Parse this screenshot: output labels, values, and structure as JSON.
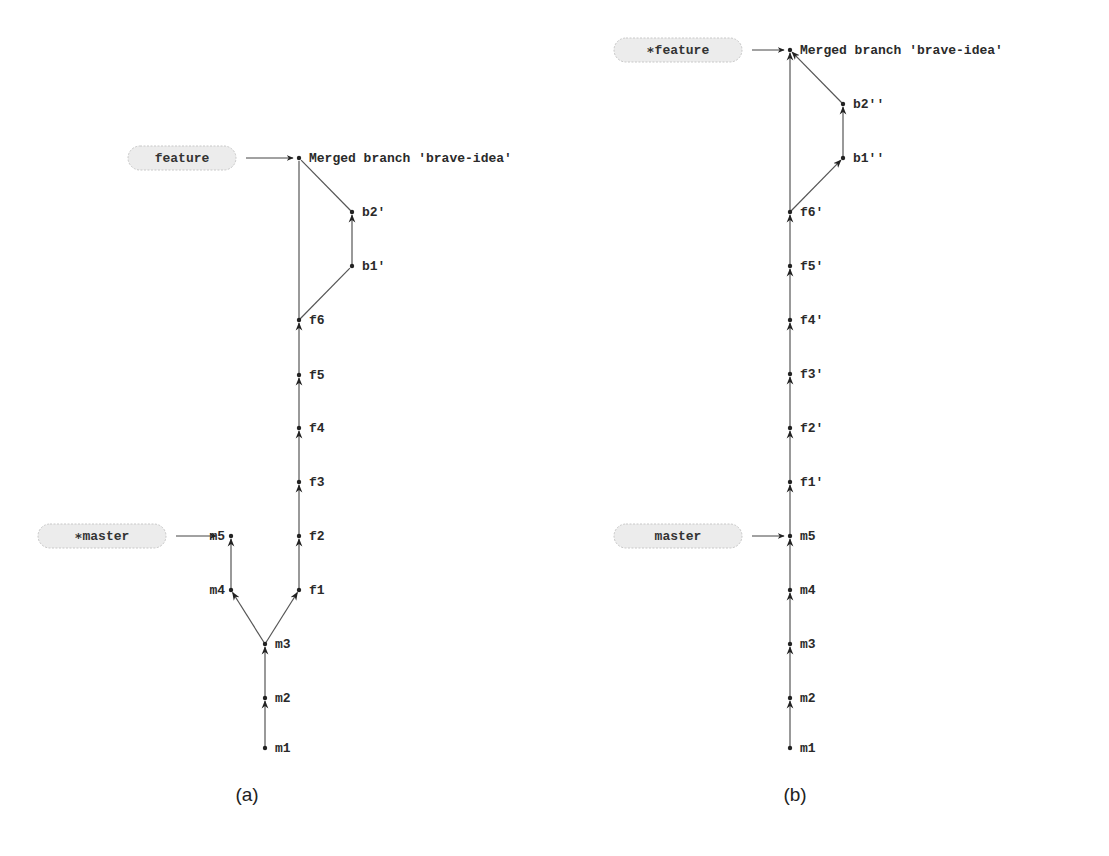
{
  "diagrams": [
    {
      "id": "a",
      "caption": "(a)",
      "caption_pos": [
        247,
        801
      ],
      "refs": [
        {
          "label": "feature",
          "star": false,
          "x": 128,
          "y": 158,
          "w": 108,
          "target": [
            299,
            158
          ]
        },
        {
          "label": "master",
          "star": true,
          "x": 38,
          "y": 536,
          "w": 128,
          "target": [
            222,
            536
          ]
        }
      ],
      "nodes": [
        {
          "id": "merge",
          "label": "Merged branch 'brave-idea'",
          "x": 299,
          "y": 158,
          "label_side": "right"
        },
        {
          "id": "b2",
          "label": "b2'",
          "x": 352,
          "y": 212,
          "label_side": "right"
        },
        {
          "id": "b1",
          "label": "b1'",
          "x": 352,
          "y": 266,
          "label_side": "right"
        },
        {
          "id": "f6",
          "label": "f6",
          "x": 299,
          "y": 320,
          "label_side": "right"
        },
        {
          "id": "f5",
          "label": "f5",
          "x": 299,
          "y": 375,
          "label_side": "right"
        },
        {
          "id": "f4",
          "label": "f4",
          "x": 299,
          "y": 428,
          "label_side": "right"
        },
        {
          "id": "f3",
          "label": "f3",
          "x": 299,
          "y": 482,
          "label_side": "right"
        },
        {
          "id": "f2",
          "label": "f2",
          "x": 299,
          "y": 536,
          "label_side": "right"
        },
        {
          "id": "f1",
          "label": "f1",
          "x": 299,
          "y": 590,
          "label_side": "right"
        },
        {
          "id": "m5",
          "label": "m5",
          "x": 231,
          "y": 536,
          "label_side": "left"
        },
        {
          "id": "m4",
          "label": "m4",
          "x": 231,
          "y": 590,
          "label_side": "left"
        },
        {
          "id": "m3",
          "label": "m3",
          "x": 265,
          "y": 644,
          "label_side": "right"
        },
        {
          "id": "m2",
          "label": "m2",
          "x": 265,
          "y": 698,
          "label_side": "right"
        },
        {
          "id": "m1",
          "label": "m1",
          "x": 265,
          "y": 748,
          "label_side": "right"
        }
      ],
      "edges": [
        {
          "from": "m1",
          "to": "m2",
          "arrow": true
        },
        {
          "from": "m2",
          "to": "m3",
          "arrow": true
        },
        {
          "from": "m3",
          "to": "m4",
          "arrow": true
        },
        {
          "from": "m4",
          "to": "m5",
          "arrow": true
        },
        {
          "from": "m3",
          "to": "f1",
          "arrow": true
        },
        {
          "from": "f1",
          "to": "f2",
          "arrow": true
        },
        {
          "from": "f2",
          "to": "f3",
          "arrow": true
        },
        {
          "from": "f3",
          "to": "f4",
          "arrow": true
        },
        {
          "from": "f4",
          "to": "f5",
          "arrow": true
        },
        {
          "from": "f5",
          "to": "f6",
          "arrow": true
        },
        {
          "from": "f6",
          "to": "b1",
          "arrow": false
        },
        {
          "from": "b1",
          "to": "b2",
          "arrow": true
        },
        {
          "from": "b2",
          "to": "merge",
          "arrow": false
        },
        {
          "from": "f6",
          "to": "merge",
          "arrow": false
        }
      ]
    },
    {
      "id": "b",
      "caption": "(b)",
      "caption_pos": [
        795,
        801
      ],
      "refs": [
        {
          "label": "feature",
          "star": true,
          "x": 614,
          "y": 50,
          "w": 128,
          "target": [
            790,
            50
          ]
        },
        {
          "label": "master",
          "star": false,
          "x": 614,
          "y": 536,
          "w": 128,
          "target": [
            790,
            536
          ]
        }
      ],
      "nodes": [
        {
          "id": "merge",
          "label": "Merged branch 'brave-idea'",
          "x": 790,
          "y": 50,
          "label_side": "right"
        },
        {
          "id": "b2",
          "label": "b2''",
          "x": 843,
          "y": 104,
          "label_side": "right"
        },
        {
          "id": "b1",
          "label": "b1''",
          "x": 843,
          "y": 158,
          "label_side": "right"
        },
        {
          "id": "f6",
          "label": "f6'",
          "x": 790,
          "y": 212,
          "label_side": "right"
        },
        {
          "id": "f5",
          "label": "f5'",
          "x": 790,
          "y": 266,
          "label_side": "right"
        },
        {
          "id": "f4",
          "label": "f4'",
          "x": 790,
          "y": 320,
          "label_side": "right"
        },
        {
          "id": "f3",
          "label": "f3'",
          "x": 790,
          "y": 374,
          "label_side": "right"
        },
        {
          "id": "f2",
          "label": "f2'",
          "x": 790,
          "y": 428,
          "label_side": "right"
        },
        {
          "id": "f1",
          "label": "f1'",
          "x": 790,
          "y": 482,
          "label_side": "right"
        },
        {
          "id": "m5",
          "label": "m5",
          "x": 790,
          "y": 536,
          "label_side": "right"
        },
        {
          "id": "m4",
          "label": "m4",
          "x": 790,
          "y": 590,
          "label_side": "right"
        },
        {
          "id": "m3",
          "label": "m3",
          "x": 790,
          "y": 644,
          "label_side": "right"
        },
        {
          "id": "m2",
          "label": "m2",
          "x": 790,
          "y": 698,
          "label_side": "right"
        },
        {
          "id": "m1",
          "label": "m1",
          "x": 790,
          "y": 748,
          "label_side": "right"
        }
      ],
      "edges": [
        {
          "from": "m1",
          "to": "m2",
          "arrow": true
        },
        {
          "from": "m2",
          "to": "m3",
          "arrow": true
        },
        {
          "from": "m3",
          "to": "m4",
          "arrow": true
        },
        {
          "from": "m4",
          "to": "m5",
          "arrow": true
        },
        {
          "from": "m5",
          "to": "f1",
          "arrow": true
        },
        {
          "from": "f1",
          "to": "f2",
          "arrow": true
        },
        {
          "from": "f2",
          "to": "f3",
          "arrow": true
        },
        {
          "from": "f3",
          "to": "f4",
          "arrow": true
        },
        {
          "from": "f4",
          "to": "f5",
          "arrow": true
        },
        {
          "from": "f5",
          "to": "f6",
          "arrow": true
        },
        {
          "from": "f6",
          "to": "b1",
          "arrow": true
        },
        {
          "from": "b1",
          "to": "b2",
          "arrow": true
        },
        {
          "from": "b2",
          "to": "merge",
          "arrow": true
        },
        {
          "from": "f6",
          "to": "merge",
          "arrow": true
        }
      ]
    }
  ]
}
